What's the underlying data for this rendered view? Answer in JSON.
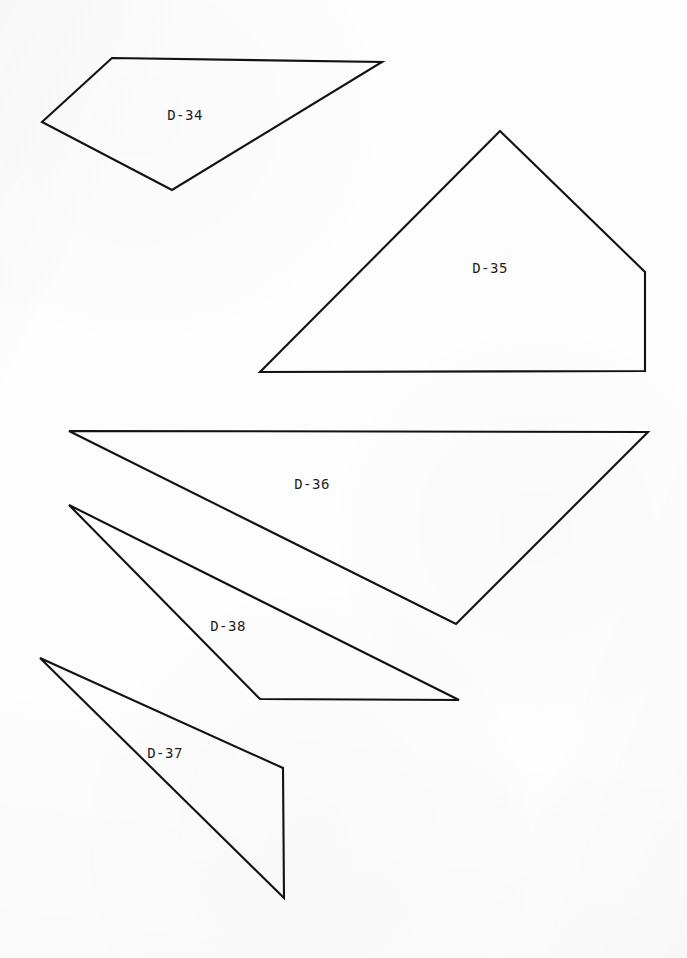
{
  "sheet": {
    "width": 687,
    "height": 958,
    "background_color": "#fdfdfd",
    "stroke_color": "#121212",
    "label_color": "#1d1d1d",
    "stroke_width": 2.1
  },
  "chart_data": {
    "type": "diagram",
    "title": "",
    "xlabel": "",
    "ylabel": "",
    "xlim": [
      0,
      687
    ],
    "ylim": [
      0,
      958
    ],
    "grid": false,
    "legend": "none",
    "shapes": [
      {
        "id": "D-34",
        "label": "D-34",
        "kind": "quadrilateral",
        "vertex_count": 4,
        "points": "112,58 382,62 172,190 42,122",
        "label_x": 185,
        "label_y": 115
      },
      {
        "id": "D-35",
        "label": "D-35",
        "kind": "pentagon",
        "vertex_count": 5,
        "points": "500,131 645,272 645,371 260,372",
        "label_x": 490,
        "label_y": 268
      },
      {
        "id": "D-36",
        "label": "D-36",
        "kind": "triangle",
        "vertex_count": 3,
        "points": "69,431 648,432 456,624",
        "label_x": 312,
        "label_y": 484
      },
      {
        "id": "D-38",
        "label": "D-38",
        "kind": "triangle",
        "vertex_count": 3,
        "points": "69,505 459,700 260,699",
        "label_x": 228,
        "label_y": 626
      },
      {
        "id": "D-37",
        "label": "D-37",
        "kind": "quadrilateral",
        "vertex_count": 4,
        "points": "40,658 283,768 284,898 40,658",
        "label_x": 165,
        "label_y": 753
      }
    ]
  }
}
